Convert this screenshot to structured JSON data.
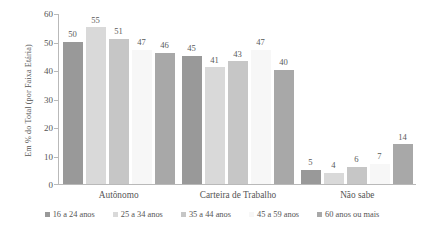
{
  "chart_data": {
    "type": "bar",
    "title": "",
    "subtitle": "",
    "xlabel": "",
    "ylabel": "Em % do Total (por Faixa Etária)",
    "ylim": [
      0,
      60
    ],
    "yticks": [
      0,
      10,
      20,
      30,
      40,
      50,
      60
    ],
    "ytick_labels": [
      "0",
      "10",
      "20",
      "30",
      "40",
      "50",
      "60"
    ],
    "grid": false,
    "legend_position": "bottom",
    "categories": [
      "Autônomo",
      "Carteira de Trabalho",
      "Não sabe"
    ],
    "series": [
      {
        "name": "16 a 24 anos",
        "color": "#999999",
        "values": [
          50,
          45,
          5
        ]
      },
      {
        "name": "25 a 34 anos",
        "color": "#d9d9d9",
        "values": [
          55,
          41,
          4
        ]
      },
      {
        "name": "35 a 44 anos",
        "color": "#c6c6c6",
        "values": [
          51,
          43,
          6
        ]
      },
      {
        "name": "45 a 59 anos",
        "color": "#f7f7f7",
        "values": [
          47,
          47,
          7
        ]
      },
      {
        "name": "60 anos ou mais",
        "color": "#a8a8a8",
        "values": [
          46,
          40,
          14
        ]
      }
    ],
    "data_labels": [
      [
        "50",
        "55",
        "51",
        "47",
        "46"
      ],
      [
        "45",
        "41",
        "43",
        "47",
        "40"
      ],
      [
        "5",
        "4",
        "6",
        "7",
        "14"
      ]
    ]
  }
}
